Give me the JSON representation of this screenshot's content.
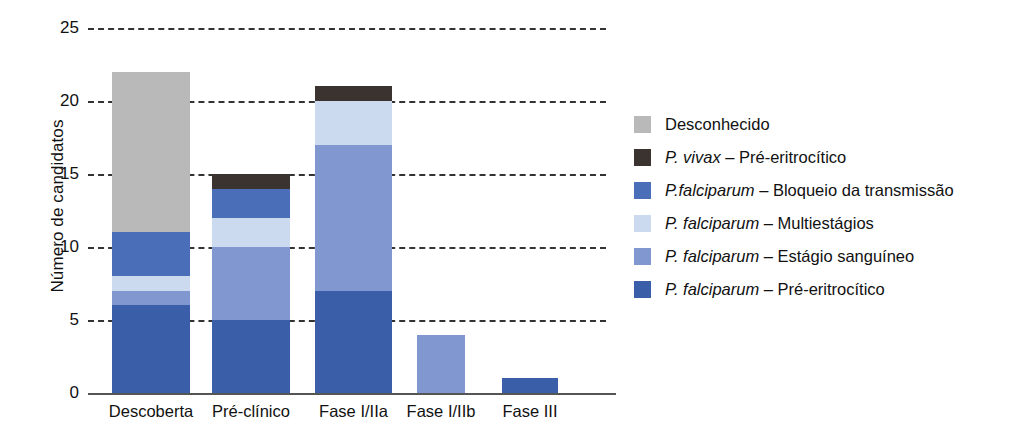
{
  "chart_data": {
    "type": "bar",
    "subtype": "stacked-bar",
    "title": "",
    "xlabel": "",
    "ylabel": "Número de candidatos",
    "ylim": [
      0,
      25
    ],
    "yticks": [
      0,
      5,
      10,
      15,
      20,
      25
    ],
    "grid": "horizontal-dashed",
    "legend_position": "right",
    "categories": [
      "Descoberta",
      "Pré-clínico",
      "Fase I/IIa",
      "Fase I/IIb",
      "Fase III"
    ],
    "series": [
      {
        "name": "P. falciparum – Pré-eritrocítico",
        "color": "#3a5ea8",
        "values": [
          6,
          5,
          7,
          0,
          1
        ]
      },
      {
        "name": "P. falciparum – Estágio sanguíneo",
        "color": "#8098cf",
        "values": [
          1,
          5,
          10,
          4,
          0
        ]
      },
      {
        "name": "P. falciparum – Multiestágios",
        "color": "#ccdaf0",
        "values": [
          1,
          2,
          3,
          0,
          0
        ]
      },
      {
        "name": "P.falciparum – Bloqueio da transmissão",
        "color": "#4a6fb8",
        "values": [
          3,
          2,
          0,
          0,
          0
        ]
      },
      {
        "name": "P. vivax – Pré-eritrocítico",
        "color": "#3a3330",
        "values": [
          0,
          1,
          1,
          0,
          0
        ]
      },
      {
        "name": "Desconhecido",
        "color": "#b9b9b9",
        "values": [
          11,
          0,
          0,
          0,
          0
        ]
      }
    ],
    "totals": [
      22,
      15,
      21,
      4,
      1
    ]
  },
  "axes": {
    "y_title": "Número de candidatos",
    "y_ticks": [
      {
        "label": "25",
        "value": 25
      },
      {
        "label": "20",
        "value": 20
      },
      {
        "label": "15",
        "value": 15
      },
      {
        "label": "10",
        "value": 10
      },
      {
        "label": "5",
        "value": 5
      },
      {
        "label": "0",
        "value": 0
      }
    ],
    "x_ticks": [
      {
        "label": "Descoberta"
      },
      {
        "label": "Pré-clínico"
      },
      {
        "label": "Fase I/IIa"
      },
      {
        "label": "Fase I/IIb"
      },
      {
        "label": "Fase III"
      }
    ]
  },
  "legend": {
    "items": [
      {
        "swatch_name": "legend-swatch-desconhecido",
        "color": "#b9b9b9",
        "italic": "",
        "rest": "Desconhecido",
        "full": "Desconhecido"
      },
      {
        "swatch_name": "legend-swatch-p-vivax-pre-eritrocitico",
        "color": "#3a3330",
        "italic": "P. vivax",
        "rest": " – Pré-eritrocítico",
        "full": "P. vivax – Pré-eritrocítico"
      },
      {
        "swatch_name": "legend-swatch-bloqueio-da-transmissao",
        "color": "#4a6fb8",
        "italic": "P.falciparum",
        "rest": " – Bloqueio da transmissão",
        "full": "P.falciparum – Bloqueio da transmissão"
      },
      {
        "swatch_name": "legend-swatch-multiestagios",
        "color": "#ccdaf0",
        "italic": "P. falciparum",
        "rest": " – Multiestágios",
        "full": "P. falciparum – Multiestágios"
      },
      {
        "swatch_name": "legend-swatch-estagio-sanguineo",
        "color": "#8098cf",
        "italic": "P. falciparum",
        "rest": " – Estágio sanguíneo",
        "full": "P. falciparum – Estágio sanguíneo"
      },
      {
        "swatch_name": "legend-swatch-p-falciparum-pre-eritrocitico",
        "color": "#3a5ea8",
        "italic": "P. falciparum",
        "rest": " – Pré-eritrocítico",
        "full": "P. falciparum – Pré-eritrocítico"
      }
    ]
  }
}
